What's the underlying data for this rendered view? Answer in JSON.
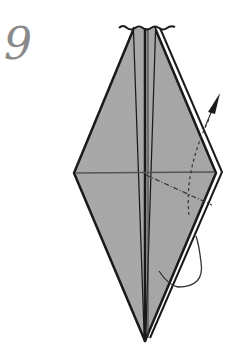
{
  "step": {
    "number": "9"
  },
  "diagram": {
    "colors": {
      "paper": "#a8a8a8",
      "outline": "#1a1a1a",
      "arrow": "#555555"
    },
    "symbols": [
      "valley-fold-line",
      "fold-arrow",
      "rotation-arrow"
    ]
  }
}
